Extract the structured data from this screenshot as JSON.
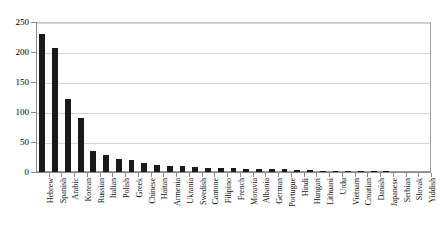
{
  "chart_data": {
    "type": "bar",
    "title": "",
    "subtitle": "",
    "xlabel": "",
    "ylabel": "",
    "ylim": [
      0,
      250
    ],
    "ytick_labels": [
      "0",
      "50",
      "100",
      "150",
      "200",
      "250"
    ],
    "ytick_values": [
      0,
      50,
      100,
      150,
      200,
      250
    ],
    "grid": true,
    "gridlines_horizontal": [
      50,
      100,
      150,
      200,
      250
    ],
    "legend": false,
    "legend_position": "none",
    "bar_color": "#1a1a1a",
    "categories": [
      "Hebrew",
      "Spanish",
      "Arabic",
      "Korean",
      "Russian",
      "Italian",
      "Polish",
      "Greek",
      "Chinese",
      "Haitan",
      "Armenia",
      "Ukrania",
      "Swedish",
      "Cantone",
      "Filipino",
      "French",
      "Moravia",
      "Albania",
      "German",
      "Portugue",
      "Hindi",
      "Hungari",
      "Lithuani",
      "Urdu",
      "Vietnam",
      "Croatian",
      "Danish",
      "Japanese",
      "Serbian",
      "Slovak",
      "Yiddish"
    ],
    "values": [
      232,
      208,
      124,
      91,
      36,
      30,
      24,
      21,
      17,
      14,
      12,
      11,
      10,
      9,
      8,
      8,
      7,
      7,
      6,
      6,
      5,
      5,
      4,
      4,
      4,
      3,
      3,
      3,
      2,
      2,
      2
    ]
  },
  "axes": {
    "y_axis_name": "y-axis",
    "x_axis_name": "x-axis"
  }
}
